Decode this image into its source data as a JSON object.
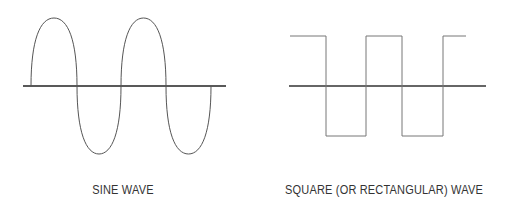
{
  "diagrams": [
    {
      "id": "sine",
      "caption": "SINE WAVE",
      "type": "sine",
      "cycles": 2,
      "start_phase": "rising from zero",
      "stroke_color": "#555555",
      "axis_color": "#222222"
    },
    {
      "id": "square",
      "caption": "SQUARE (OR RECTANGULAR) WAVE",
      "type": "square",
      "cycles": 2,
      "start_level": "high",
      "stroke_color": "#777777",
      "axis_color": "#333333"
    }
  ]
}
